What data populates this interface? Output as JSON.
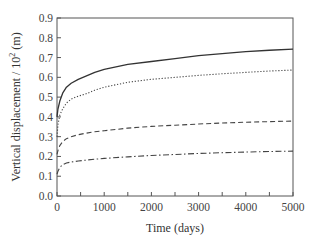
{
  "chart_data": {
    "type": "line",
    "title": "",
    "xlabel": "Time (days)",
    "ylabel": "Vertical displacement / 10² (m)",
    "ylabel_main": "Vertical displacement / 10",
    "ylabel_sup": "2",
    "ylabel_unit": " (m)",
    "xlim": [
      0,
      5000
    ],
    "ylim": [
      0,
      0.9
    ],
    "xticks": [
      0,
      1000,
      2000,
      3000,
      4000,
      5000
    ],
    "xtick_labels": [
      "0",
      "1000",
      "2000",
      "3000",
      "4000",
      "5000"
    ],
    "xminor_step": 500,
    "yticks": [
      0.0,
      0.1,
      0.2,
      0.3,
      0.4,
      0.5,
      0.6,
      0.7,
      0.8,
      0.9
    ],
    "ytick_labels": [
      "0.0",
      "0.1",
      "0.2",
      "0.3",
      "0.4",
      "0.5",
      "0.6",
      "0.7",
      "0.8",
      "0.9"
    ],
    "grid": false,
    "legend": null,
    "series": [
      {
        "name": "solid",
        "style": "solid",
        "color": "#333333",
        "x": [
          0,
          20,
          60,
          120,
          200,
          300,
          450,
          600,
          800,
          1000,
          1500,
          2000,
          2500,
          3000,
          3500,
          4000,
          4500,
          5000
        ],
        "values": [
          0.4,
          0.44,
          0.48,
          0.52,
          0.55,
          0.57,
          0.59,
          0.605,
          0.625,
          0.64,
          0.665,
          0.68,
          0.695,
          0.71,
          0.72,
          0.73,
          0.737,
          0.743
        ]
      },
      {
        "name": "dotted",
        "style": "dotted",
        "color": "#444444",
        "x": [
          0,
          20,
          60,
          120,
          200,
          300,
          450,
          600,
          800,
          1000,
          1500,
          2000,
          2500,
          3000,
          3500,
          4000,
          4500,
          5000
        ],
        "values": [
          0.3,
          0.36,
          0.41,
          0.44,
          0.47,
          0.49,
          0.505,
          0.515,
          0.535,
          0.55,
          0.575,
          0.59,
          0.6,
          0.61,
          0.618,
          0.625,
          0.632,
          0.637
        ]
      },
      {
        "name": "dashed",
        "style": "dashed",
        "color": "#444444",
        "x": [
          0,
          20,
          60,
          120,
          200,
          300,
          450,
          600,
          800,
          1000,
          1500,
          2000,
          2500,
          3000,
          3500,
          4000,
          4500,
          5000
        ],
        "values": [
          0.21,
          0.23,
          0.255,
          0.275,
          0.29,
          0.3,
          0.31,
          0.317,
          0.325,
          0.33,
          0.343,
          0.352,
          0.358,
          0.364,
          0.369,
          0.373,
          0.376,
          0.379
        ]
      },
      {
        "name": "dash-dot",
        "style": "dashdot",
        "color": "#444444",
        "x": [
          0,
          20,
          60,
          120,
          200,
          300,
          450,
          600,
          800,
          1000,
          1500,
          2000,
          2500,
          3000,
          3500,
          4000,
          4500,
          5000
        ],
        "values": [
          0.11,
          0.125,
          0.145,
          0.158,
          0.167,
          0.172,
          0.177,
          0.181,
          0.186,
          0.19,
          0.198,
          0.205,
          0.21,
          0.215,
          0.219,
          0.222,
          0.225,
          0.227
        ]
      }
    ]
  }
}
